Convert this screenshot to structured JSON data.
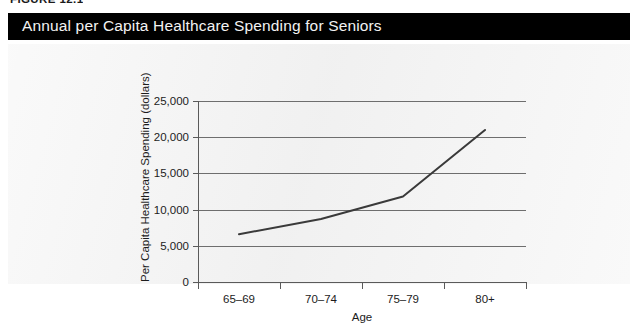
{
  "figure": {
    "number_label": "FIGURE 12.1"
  },
  "title_bar": {
    "title": "Annual per Capita Healthcare Spending for Seniors"
  },
  "colors": {
    "banner_background": "#000000",
    "banner_text": "#f2f2f2",
    "panel_background": "#f3f3f3",
    "gridline": "#6e6e6e",
    "axis": "#5a5a5a",
    "series_line": "#3a3a3a",
    "tick_text": "#1c1c1c"
  },
  "chart_data": {
    "type": "line",
    "title": "Annual per Capita Healthcare Spending for Seniors",
    "xlabel": "Age",
    "ylabel": "Per Capita Healthcare Spending (dollars)",
    "categories": [
      "65–69",
      "70–74",
      "75–79",
      "80+"
    ],
    "values": [
      6600,
      8700,
      11800,
      21000
    ],
    "series": [
      {
        "name": "Per Capita Healthcare Spending",
        "values": [
          6600,
          8700,
          11800,
          21000
        ]
      }
    ],
    "ylim": [
      0,
      25000
    ],
    "yticks": [
      0,
      5000,
      10000,
      15000,
      20000,
      25000
    ],
    "ytick_labels": [
      "0",
      "5,000",
      "10,000",
      "15,000",
      "20,000",
      "25,000"
    ],
    "xtick_labels": [
      "65–69",
      "70–74",
      "75–79",
      "80+"
    ],
    "grid": true,
    "grid_axis": "y",
    "legend": false,
    "legend_position": "none",
    "markers": false
  }
}
